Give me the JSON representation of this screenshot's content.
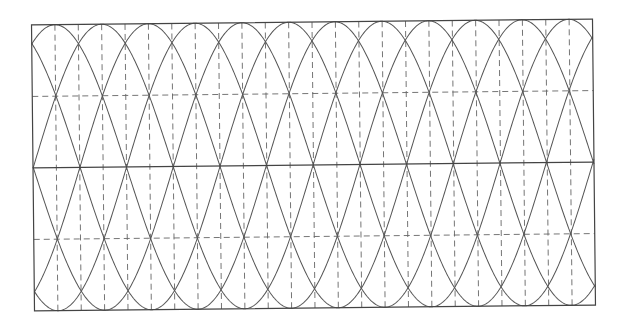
{
  "figure": {
    "frame": {
      "x": 33,
      "y": 22,
      "width": 561,
      "height": 286,
      "rotation_deg": -0.6
    },
    "grid": {
      "vertical_dashed_divisions": 24,
      "horizontal_dashed_levels": [
        0.25,
        0.75
      ],
      "solid_midline": 0.5
    },
    "curves": {
      "period_px": 280,
      "phase_step_px": 46.67,
      "first_peak_px": 23.33,
      "copies": 6,
      "families": 2
    },
    "colors": {
      "line": "#555555",
      "frame": "#444444",
      "dash": "#666666",
      "background": "#ffffff"
    }
  }
}
